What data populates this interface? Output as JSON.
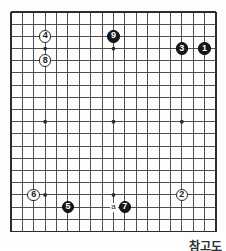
{
  "figure": {
    "caption": "참고도",
    "board": {
      "size": 19,
      "line_color": "#3a3c3f",
      "border_color": "#2a2c2f",
      "background_color": "#fdfdfb",
      "star_points": [
        {
          "col": 4,
          "row": 4
        },
        {
          "col": 10,
          "row": 4
        },
        {
          "col": 16,
          "row": 4
        },
        {
          "col": 4,
          "row": 10
        },
        {
          "col": 10,
          "row": 10
        },
        {
          "col": 16,
          "row": 10
        },
        {
          "col": 4,
          "row": 16
        },
        {
          "col": 10,
          "row": 16
        },
        {
          "col": 16,
          "row": 16
        }
      ]
    },
    "colors": {
      "black_stone": "#15171a",
      "white_stone": "#fcfcfc",
      "black_label": "#ffffff",
      "white_label": "#1a1c1f"
    },
    "stones": [
      {
        "label": "1",
        "color": "black",
        "col": 18,
        "row": 4
      },
      {
        "label": "2",
        "color": "white",
        "col": 16,
        "row": 16
      },
      {
        "label": "3",
        "color": "black",
        "col": 16,
        "row": 4
      },
      {
        "label": "4",
        "color": "white",
        "col": 4,
        "row": 3
      },
      {
        "label": "5",
        "color": "black",
        "col": 6,
        "row": 17
      },
      {
        "label": "6",
        "color": "white",
        "col": 3,
        "row": 16
      },
      {
        "label": "7",
        "color": "black",
        "col": 11,
        "row": 17
      },
      {
        "label": "8",
        "color": "white",
        "col": 4,
        "row": 5
      },
      {
        "label": "9",
        "color": "black",
        "col": 10,
        "row": 3
      }
    ],
    "markers": [
      {
        "label": "a",
        "col": 10,
        "row": 17
      }
    ]
  }
}
